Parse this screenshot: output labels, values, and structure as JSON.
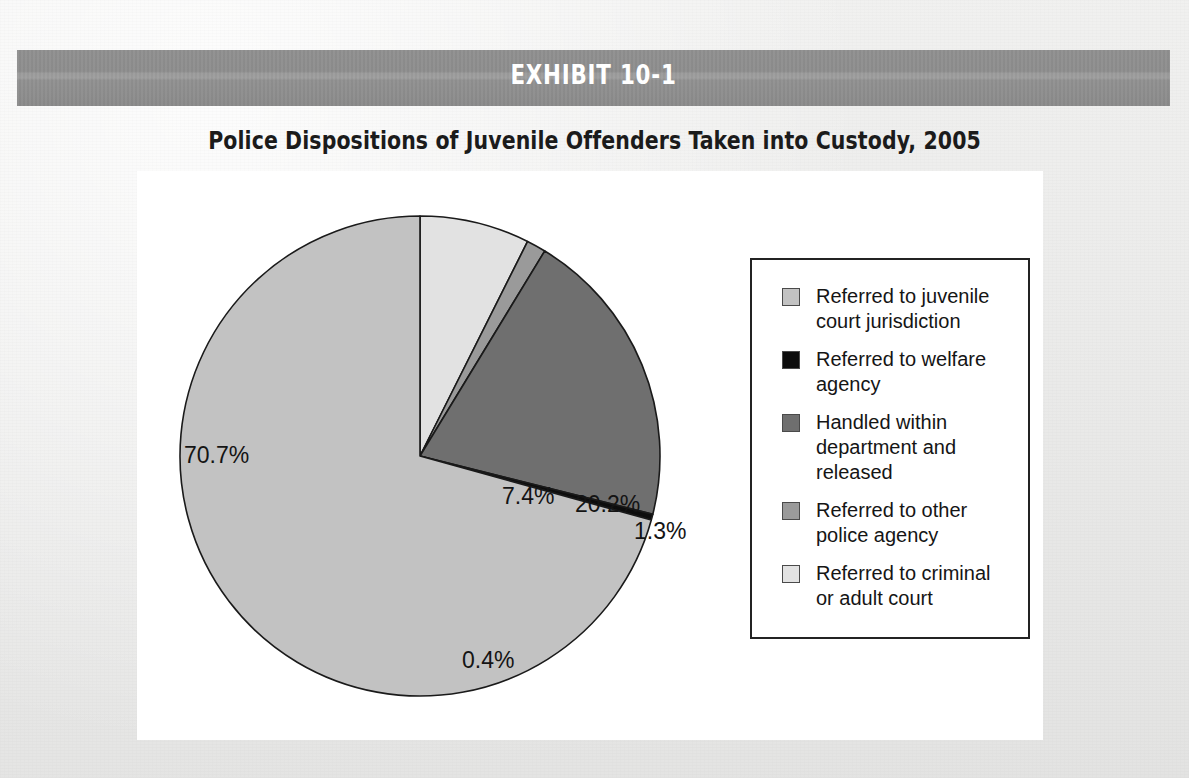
{
  "exhibit": {
    "bar_label": "EXHIBIT 10-1",
    "bar_color": "#8f8f8f",
    "bar_text_color": "#ffffff"
  },
  "chart_title": "Police Dispositions of Juvenile Offenders Taken into Custody, 2005",
  "page": {
    "background_color": "#ebebea",
    "panel_color": "#ffffff",
    "bottom_caption": ""
  },
  "legend": {
    "border_color": "#232323",
    "items": [
      {
        "label": "Referred to juvenile\ncourt jurisdiction",
        "color": "#c2c2c2"
      },
      {
        "label": "Referred to welfare\nagency",
        "color": "#0d0d0d"
      },
      {
        "label": "Handled within\ndepartment and\nreleased",
        "color": "#6f6f6f"
      },
      {
        "label": "Referred to other\npolice agency",
        "color": "#9a9a9a"
      },
      {
        "label": "Referred to criminal\nor adult court",
        "color": "#e2e2e2"
      }
    ]
  },
  "chart_data": {
    "type": "pie",
    "title": "Police Dispositions of Juvenile Offenders Taken into Custody, 2005",
    "categories": [
      "Referred to juvenile court jurisdiction",
      "Referred to welfare agency",
      "Handled within department and released",
      "Referred to other police agency",
      "Referred to criminal or adult court"
    ],
    "values": [
      70.7,
      0.4,
      20.2,
      1.3,
      7.4
    ],
    "value_labels": [
      "70.7%",
      "0.4%",
      "20.2%",
      "1.3%",
      "7.4%"
    ],
    "units": "percent",
    "total": 100.0,
    "legend_position": "right",
    "slice_colors": [
      "#c2c2c2",
      "#0d0d0d",
      "#6f6f6f",
      "#9a9a9a",
      "#e2e2e2"
    ],
    "slices": [
      {
        "label": "Referred to criminal or adult court",
        "value": 7.4,
        "display": "7.4%",
        "color": "#e2e2e2",
        "start_deg": 0.0,
        "end_deg": 26.64
      },
      {
        "label": "Referred to other police agency",
        "value": 1.3,
        "display": "1.3%",
        "color": "#9a9a9a",
        "start_deg": 26.64,
        "end_deg": 31.32
      },
      {
        "label": "Handled within department and released",
        "value": 20.2,
        "display": "20.2%",
        "color": "#6f6f6f",
        "start_deg": 31.32,
        "end_deg": 104.04
      },
      {
        "label": "Referred to welfare agency",
        "value": 0.4,
        "display": "0.4%",
        "color": "#0d0d0d",
        "start_deg": 104.04,
        "end_deg": 105.48
      },
      {
        "label": "Referred to juvenile court jurisdiction",
        "value": 70.7,
        "display": "70.7%",
        "color": "#c2c2c2",
        "start_deg": 105.48,
        "end_deg": 360.0
      }
    ],
    "labels": {
      "s74": "7.4%",
      "s13": "1.3%",
      "s202": "20.2%",
      "s04": "0.4%",
      "s707": "70.7%"
    }
  }
}
